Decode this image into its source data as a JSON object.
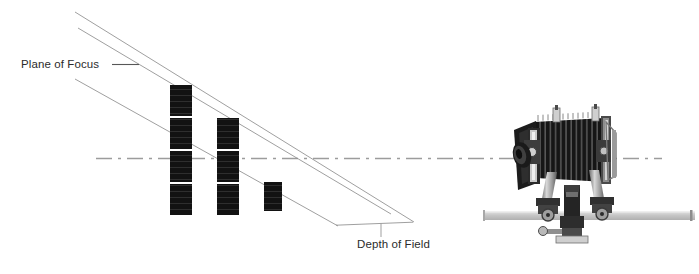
{
  "figure": {
    "type": "technical-illustration",
    "width": 699,
    "height": 274,
    "background_color": "#ffffff",
    "line_color": "#8a8a8a",
    "subject_color": "#141414",
    "axis_color": "#9a9a9a",
    "rail_color": "#c9c9c9"
  },
  "labels": {
    "plane_of_focus": "Plane of Focus",
    "depth_of_field": "Depth of Field"
  },
  "annotations": {
    "plane_of_focus_leader": {
      "name": "plane-of-focus-leader",
      "from": [
        112,
        65
      ],
      "to": [
        137,
        65
      ]
    },
    "depth_of_field_bracket": {
      "name": "depth-of-field-bracket",
      "left": [
        334,
        225
      ],
      "apex": [
        412,
        222
      ],
      "stem_bottom": [
        381,
        236
      ]
    }
  },
  "optical_axis": {
    "name": "optical-axis",
    "y": 158,
    "x_start": 96,
    "x_end": 662,
    "style": "dash-dot"
  },
  "rays": [
    {
      "name": "near-limit-ray",
      "from": [
        75,
        12
      ],
      "to": [
        414,
        222
      ]
    },
    {
      "name": "plane-of-focus-ray",
      "from": [
        78,
        28
      ],
      "to": [
        391,
        214
      ]
    },
    {
      "name": "far-limit-ray",
      "from": [
        75,
        79
      ],
      "to": [
        338,
        226
      ]
    }
  ],
  "subject_columns": [
    {
      "name": "subject-column-near",
      "x": 170,
      "width": 22,
      "bars": [
        {
          "y": 85,
          "height": 31
        },
        {
          "y": 118,
          "height": 31
        },
        {
          "y": 151,
          "height": 31
        },
        {
          "y": 184,
          "height": 31
        }
      ]
    },
    {
      "name": "subject-column-mid",
      "x": 217,
      "width": 22,
      "bars": [
        {
          "y": 118,
          "height": 31
        },
        {
          "y": 151,
          "height": 31
        },
        {
          "y": 184,
          "height": 31
        }
      ]
    },
    {
      "name": "subject-column-far",
      "x": 264,
      "width": 18,
      "bars": [
        {
          "y": 182,
          "height": 29
        }
      ]
    }
  ],
  "camera": {
    "name": "view-camera",
    "description": "large-format view camera with bellows, tilted lens board, standards and tripod head on rail",
    "body": {
      "x": 532,
      "y": 120,
      "width": 72,
      "height": 58
    },
    "bellows_pleats": 13,
    "lens": {
      "cx": 528,
      "cy": 155,
      "rx": 10,
      "ry": 13
    },
    "rail": {
      "x": 483,
      "y": 212,
      "width": 212,
      "height": 8
    }
  }
}
